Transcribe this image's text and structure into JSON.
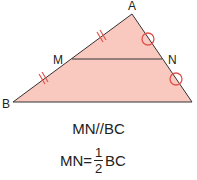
{
  "diagram": {
    "fill_color": "#f9c9bf",
    "line_color": "#333333",
    "mark_color": "#e0524a",
    "vertices": {
      "A": {
        "label": "A",
        "x": 132,
        "y": 14
      },
      "B": {
        "label": "B",
        "x": 13,
        "y": 102
      },
      "C": {
        "label": "C",
        "x": 192,
        "y": 102
      },
      "M": {
        "label": "M",
        "x": 72,
        "y": 59
      },
      "N": {
        "label": "N",
        "x": 162,
        "y": 59
      }
    }
  },
  "captions": {
    "parallel": "MN//BC",
    "formula_left": "MN=",
    "fraction_num": "1",
    "fraction_den": "2",
    "formula_right": "BC"
  }
}
